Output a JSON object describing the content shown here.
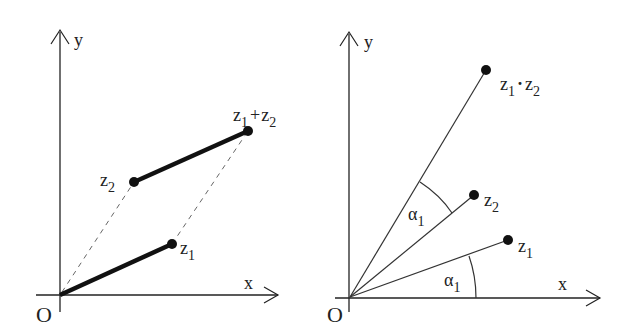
{
  "left": {
    "axis_x_label": "x",
    "axis_y_label": "y",
    "origin_label": "O",
    "points": {
      "z1": {
        "label": "z",
        "sub": "1"
      },
      "z2": {
        "label": "z",
        "sub": "2"
      },
      "sum": {
        "label_a": "z",
        "sub_a": "1",
        "op": "+",
        "label_b": "z",
        "sub_b": "2"
      }
    }
  },
  "right": {
    "axis_x_label": "x",
    "axis_y_label": "y",
    "origin_label": "O",
    "points": {
      "z1": {
        "label": "z",
        "sub": "1"
      },
      "z2": {
        "label": "z",
        "sub": "2"
      },
      "product": {
        "label_a": "z",
        "sub_a": "1",
        "op": "·",
        "label_b": "z",
        "sub_b": "2"
      }
    },
    "angles": [
      {
        "label": "α",
        "sub": "1"
      },
      {
        "label": "α",
        "sub": "1"
      }
    ]
  },
  "colors": {
    "ink": "#1a1a1a",
    "dashed": "#666666"
  }
}
